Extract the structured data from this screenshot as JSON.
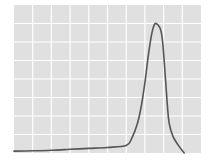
{
  "chart_data": {
    "type": "line",
    "title": "",
    "xlabel": "",
    "ylabel": "",
    "xlim": [
      0,
      10
    ],
    "ylim": [
      0,
      8
    ],
    "grid": true,
    "legend": null,
    "colors": {
      "panel": "#e0e0e0",
      "grid": "#ffffff",
      "line": "#555555",
      "background": "#ffffff"
    },
    "series": [
      {
        "name": "peak",
        "x": [
          0,
          1,
          2,
          3,
          4,
          5,
          6.0,
          6.3,
          6.6,
          6.8,
          7.0,
          7.2,
          7.4,
          7.6,
          7.9,
          8.1,
          8.2,
          8.3,
          8.5,
          8.8,
          9.1
        ],
        "y": [
          0.1,
          0.12,
          0.15,
          0.2,
          0.25,
          0.3,
          0.4,
          0.8,
          1.6,
          2.5,
          3.8,
          5.4,
          6.6,
          7.0,
          6.4,
          4.0,
          2.6,
          1.6,
          0.9,
          0.4,
          0.0
        ]
      }
    ]
  }
}
